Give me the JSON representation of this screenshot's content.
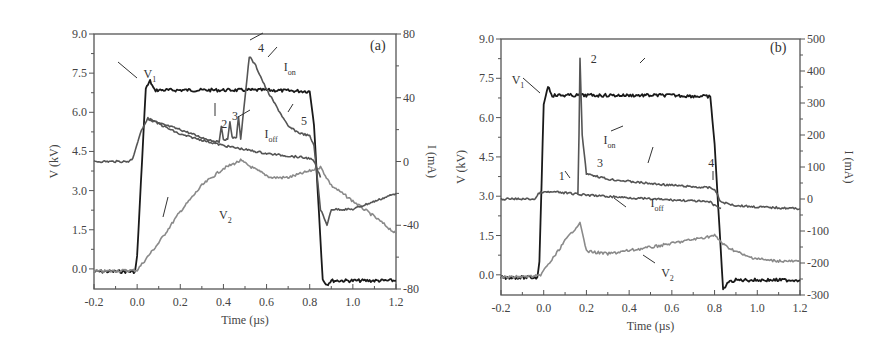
{
  "chart_data": [
    {
      "panel": "(a)",
      "type": "line",
      "xlabel": "Time (µs)",
      "ylabel": "V (kV)",
      "ylabel_right": "I (mA)",
      "xlim": [
        -0.2,
        1.2
      ],
      "ylim": [
        -0.77,
        9.0
      ],
      "ylim_right": [
        -80,
        80
      ],
      "x_ticks": [
        "-0.2",
        "0.0",
        "0.2",
        "0.4",
        "0.6",
        "0.8",
        "1.0",
        "1.2"
      ],
      "y_ticks": [
        "0.0",
        "1.5",
        "3.0",
        "4.5",
        "6.0",
        "7.5",
        "9.0"
      ],
      "y_ticks_right": [
        "-80",
        "-40",
        "0",
        "40",
        "80"
      ],
      "series": [
        {
          "name": "V1",
          "axis": "left",
          "color": "#1a1a1a",
          "x": [
            -0.2,
            -0.01,
            0.0,
            0.04,
            0.06,
            0.08,
            0.2,
            0.4,
            0.6,
            0.8,
            0.82,
            0.86,
            0.88,
            0.9,
            1.0,
            1.2
          ],
          "y": [
            -0.1,
            -0.1,
            0.5,
            6.9,
            7.2,
            6.85,
            6.85,
            6.85,
            6.85,
            6.8,
            5.5,
            -0.4,
            -0.6,
            -0.45,
            -0.45,
            -0.45
          ]
        },
        {
          "name": "V2",
          "axis": "left",
          "color": "#8a8a8a",
          "x": [
            -0.2,
            0.0,
            0.1,
            0.2,
            0.3,
            0.4,
            0.48,
            0.55,
            0.62,
            0.7,
            0.8,
            0.85,
            0.9,
            1.0,
            1.1,
            1.2
          ],
          "y": [
            -0.1,
            -0.05,
            1.0,
            2.2,
            3.2,
            3.85,
            4.15,
            3.8,
            3.5,
            3.5,
            3.75,
            3.9,
            3.2,
            2.6,
            2.0,
            1.35
          ]
        },
        {
          "name": "I_on",
          "axis": "right",
          "color": "#555555",
          "x": [
            -0.2,
            -0.04,
            -0.02,
            0.02,
            0.05,
            0.1,
            0.2,
            0.3,
            0.38,
            0.39,
            0.4,
            0.42,
            0.43,
            0.44,
            0.46,
            0.47,
            0.48,
            0.5,
            0.52,
            0.55,
            0.6,
            0.7,
            0.75,
            0.8,
            0.82,
            0.85,
            0.88,
            0.9,
            1.0,
            1.1,
            1.2
          ],
          "y": [
            0,
            0,
            2,
            20,
            27,
            24,
            20,
            15,
            12,
            22,
            14,
            14,
            25,
            15,
            15,
            28,
            14,
            40,
            66,
            60,
            45,
            22,
            18,
            16,
            10,
            -30,
            -40,
            -30,
            -30,
            -25,
            -20
          ]
        },
        {
          "name": "I_off",
          "axis": "right",
          "color": "#555555",
          "x": [
            0.05,
            0.2,
            0.4,
            0.6,
            0.8,
            0.82,
            0.85
          ],
          "y": [
            27,
            17,
            10,
            5,
            2,
            0,
            -10
          ]
        }
      ],
      "annotations": [
        {
          "text": "V1",
          "x": 0.03,
          "y": 7.3
        },
        {
          "text": "V2",
          "x": 0.38,
          "y": 1.9
        },
        {
          "text": "I_on",
          "x": 0.68,
          "y": 7.6
        },
        {
          "text": "I_off",
          "x": 0.59,
          "y": 5.0
        },
        {
          "text": "2",
          "x": 0.39,
          "y": 5.4
        },
        {
          "text": "3",
          "x": 0.44,
          "y": 5.7
        },
        {
          "text": "4",
          "x": 0.56,
          "y": 8.3
        },
        {
          "text": "5",
          "x": 0.76,
          "y": 5.5
        },
        {
          "text": "(a)",
          "x": 1.08,
          "y": 8.4
        }
      ]
    },
    {
      "panel": "(b)",
      "type": "line",
      "xlabel": "Time (µs)",
      "ylabel": "V (kV)",
      "ylabel_right": "I (mA)",
      "xlim": [
        -0.2,
        1.2
      ],
      "ylim": [
        -0.77,
        9.0
      ],
      "ylim_right": [
        -300,
        500
      ],
      "x_ticks": [
        "-0.2",
        "0.0",
        "0.2",
        "0.4",
        "0.6",
        "0.8",
        "1.0",
        "1.2"
      ],
      "y_ticks": [
        "0.0",
        "1.5",
        "3.0",
        "4.5",
        "6.0",
        "7.5",
        "9.0"
      ],
      "y_ticks_right": [
        "-300",
        "-200",
        "-100",
        "0",
        "100",
        "200",
        "300",
        "400",
        "500"
      ],
      "series": [
        {
          "name": "V1",
          "axis": "left",
          "color": "#1a1a1a",
          "x": [
            -0.2,
            -0.03,
            -0.02,
            0.0,
            0.02,
            0.04,
            0.2,
            0.4,
            0.6,
            0.78,
            0.8,
            0.84,
            0.86,
            0.9,
            1.0,
            1.2
          ],
          "y": [
            -0.1,
            -0.1,
            0.5,
            6.5,
            7.2,
            6.85,
            6.85,
            6.85,
            6.85,
            6.8,
            5.0,
            -0.6,
            -0.3,
            -0.2,
            -0.2,
            -0.2
          ]
        },
        {
          "name": "V2",
          "axis": "left",
          "color": "#8a8a8a",
          "x": [
            -0.2,
            -0.02,
            0.05,
            0.1,
            0.17,
            0.2,
            0.3,
            0.5,
            0.7,
            0.8,
            0.85,
            0.95,
            1.05,
            1.2
          ],
          "y": [
            -0.1,
            -0.05,
            0.7,
            1.3,
            2.0,
            0.9,
            0.8,
            1.05,
            1.35,
            1.5,
            1.1,
            0.7,
            0.55,
            0.5
          ]
        },
        {
          "name": "I_on",
          "axis": "right",
          "color": "#555555",
          "x": [
            -0.2,
            -0.04,
            -0.02,
            0.05,
            0.16,
            0.165,
            0.17,
            0.18,
            0.2,
            0.3,
            0.5,
            0.7,
            0.78,
            0.8,
            0.83,
            0.9,
            1.0,
            1.2
          ],
          "y": [
            0,
            0,
            20,
            22,
            15,
            200,
            440,
            200,
            80,
            62,
            48,
            38,
            35,
            30,
            -10,
            -20,
            -25,
            -30
          ]
        },
        {
          "name": "I_off",
          "axis": "right",
          "color": "#555555",
          "x": [
            0.16,
            0.3,
            0.5,
            0.7,
            0.78,
            0.8,
            0.83
          ],
          "y": [
            14,
            8,
            0,
            -6,
            -10,
            -20,
            -30
          ]
        }
      ],
      "annotations": [
        {
          "text": "V1",
          "x": -0.15,
          "y": 7.3
        },
        {
          "text": "V2",
          "x": 0.55,
          "y": -0.1
        },
        {
          "text": "I_on",
          "x": 0.28,
          "y": 5.0
        },
        {
          "text": "I_off",
          "x": 0.5,
          "y": 2.6
        },
        {
          "text": "1",
          "x": 0.07,
          "y": 3.6
        },
        {
          "text": "2",
          "x": 0.22,
          "y": 8.1
        },
        {
          "text": "3",
          "x": 0.25,
          "y": 4.1
        },
        {
          "text": "4",
          "x": 0.77,
          "y": 4.1
        },
        {
          "text": "(b)",
          "x": 1.06,
          "y": 8.5
        }
      ]
    }
  ],
  "panels": [
    {
      "id": "a",
      "label": "(a)",
      "xlabel": "Time (µs)",
      "ylabel": "V (kV)",
      "ylabel_right": "I (mA)"
    },
    {
      "id": "b",
      "label": "(b)",
      "xlabel": "Time (µs)",
      "ylabel": "V (kV)",
      "ylabel_right": "I (mA)"
    }
  ]
}
